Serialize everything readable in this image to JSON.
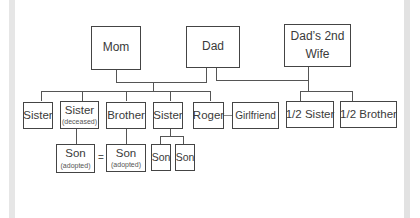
{
  "diagram": {
    "type": "family-tree",
    "parents": [
      {
        "id": "mom",
        "label": "Mom"
      },
      {
        "id": "dad",
        "label": "Dad"
      },
      {
        "id": "dads_2nd_wife",
        "label": "Dad’s 2nd Wife",
        "line1": "Dad’s 2nd",
        "line2": "Wife"
      }
    ],
    "children_mom_dad": [
      {
        "id": "sister1",
        "label": "Sister"
      },
      {
        "id": "sister2",
        "label": "Sister",
        "note": "(deceased)"
      },
      {
        "id": "brother",
        "label": "Brother"
      },
      {
        "id": "sister3",
        "label": "Sister"
      },
      {
        "id": "roger",
        "label": "Roger"
      }
    ],
    "partner": {
      "id": "girlfriend",
      "label": "Girlfriend",
      "partner_of": "roger"
    },
    "children_dad_2nd_wife": [
      {
        "id": "half_sister",
        "label": "1/2 Sister"
      },
      {
        "id": "half_brother",
        "label": "1/2 Brother"
      }
    ],
    "grandchildren": [
      {
        "id": "son_adopted_1",
        "label": "Son",
        "note": "(adopted)",
        "parent": "sister2"
      },
      {
        "id": "son_adopted_2",
        "label": "Son",
        "note": "(adopted)",
        "parent": "brother"
      },
      {
        "id": "son_1",
        "label": "Son",
        "parent": "sister3"
      },
      {
        "id": "son_2",
        "label": "Son",
        "parent": "sister3"
      }
    ],
    "equal_sign": "=",
    "relations": [
      {
        "from": "mom",
        "to": "dad",
        "type": "couple"
      },
      {
        "from": "dad",
        "to": "dads_2nd_wife",
        "type": "couple"
      },
      {
        "from": "roger",
        "to": "girlfriend",
        "type": "partner"
      },
      {
        "from": "son_adopted_1",
        "to": "son_adopted_2",
        "type": "same-person"
      }
    ]
  }
}
